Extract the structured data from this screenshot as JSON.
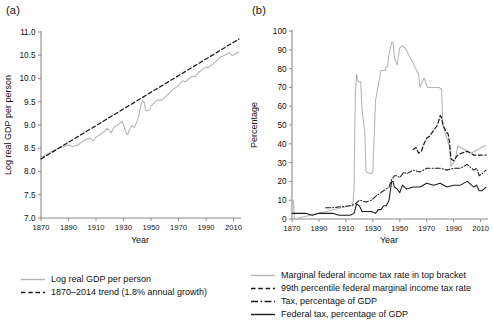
{
  "figure": {
    "panel_a_label": "(a)",
    "panel_b_label": "(b)"
  },
  "chart_data": [
    {
      "id": "panel_a",
      "type": "line",
      "title": "(a)",
      "xlabel": "Year",
      "ylabel": "Log real GDP per person",
      "xlim": [
        1870,
        2014
      ],
      "ylim": [
        7.0,
        11.0
      ],
      "xticks": [
        1870,
        1890,
        1910,
        1930,
        1950,
        1970,
        1990,
        2010
      ],
      "yticks": [
        7.0,
        7.5,
        8.0,
        8.5,
        9.0,
        9.5,
        10.0,
        10.5,
        11.0
      ],
      "ytick_labels": [
        "7.0",
        "7.5",
        "8.0",
        "8.5",
        "9.0",
        "9.5",
        "10.0",
        "10.5",
        "11.0"
      ],
      "grid": false,
      "legend_position": "below",
      "series": [
        {
          "name": "Log real GDP per person",
          "style": "solid",
          "color": "#b3b3b3",
          "x": [
            1870,
            1875,
            1880,
            1885,
            1890,
            1893,
            1896,
            1900,
            1905,
            1908,
            1910,
            1913,
            1916,
            1918,
            1920,
            1921,
            1923,
            1925,
            1929,
            1930,
            1932,
            1933,
            1934,
            1936,
            1938,
            1939,
            1941,
            1943,
            1944,
            1945,
            1946,
            1947,
            1949,
            1950,
            1953,
            1955,
            1958,
            1960,
            1965,
            1970,
            1973,
            1975,
            1980,
            1982,
            1985,
            1990,
            1991,
            1995,
            2000,
            2005,
            2007,
            2009,
            2011,
            2014
          ],
          "y": [
            8.3,
            8.38,
            8.47,
            8.52,
            8.57,
            8.54,
            8.56,
            8.64,
            8.72,
            8.66,
            8.74,
            8.79,
            8.86,
            8.93,
            8.88,
            8.83,
            8.95,
            8.98,
            9.08,
            9.0,
            8.82,
            8.79,
            8.87,
            8.99,
            8.95,
            9.02,
            9.18,
            9.47,
            9.53,
            9.5,
            9.32,
            9.3,
            9.33,
            9.4,
            9.5,
            9.54,
            9.53,
            9.59,
            9.74,
            9.85,
            9.95,
            9.93,
            10.05,
            10.04,
            10.14,
            10.25,
            10.23,
            10.31,
            10.45,
            10.52,
            10.55,
            10.49,
            10.52,
            10.57
          ]
        },
        {
          "name": "1870–2014 trend (1.8% annual growth)",
          "style": "dashed",
          "color": "#1a1a1a",
          "x": [
            1870,
            2014
          ],
          "y": [
            8.27,
            10.85
          ]
        }
      ],
      "legend": [
        {
          "label": "Log real GDP per person",
          "style": "solid",
          "color": "#b3b3b3"
        },
        {
          "label": "1870–2014 trend (1.8% annual growth)",
          "style": "dashed",
          "color": "#1a1a1a"
        }
      ]
    },
    {
      "id": "panel_b",
      "type": "line",
      "title": "(b)",
      "xlabel": "Year",
      "ylabel": "Percentage",
      "xlim": [
        1870,
        2014
      ],
      "ylim": [
        0,
        100
      ],
      "xticks": [
        1870,
        1890,
        1910,
        1930,
        1950,
        1970,
        1990,
        2010
      ],
      "yticks": [
        0,
        10,
        20,
        30,
        40,
        50,
        60,
        70,
        80,
        90,
        100
      ],
      "ytick_labels": [
        "0",
        "10",
        "20",
        "30",
        "40",
        "50",
        "60",
        "70",
        "80",
        "90",
        "100"
      ],
      "grid": false,
      "legend_position": "below",
      "series": [
        {
          "name": "Marginal federal income tax rate in top bracket",
          "style": "solid",
          "color": "#b3b3b3",
          "x": [
            1870,
            1871,
            1872,
            1913,
            1915,
            1916,
            1917,
            1918,
            1919,
            1921,
            1922,
            1924,
            1925,
            1929,
            1930,
            1932,
            1936,
            1939,
            1940,
            1941,
            1942,
            1944,
            1945,
            1946,
            1948,
            1950,
            1952,
            1954,
            1964,
            1965,
            1968,
            1970,
            1971,
            1976,
            1979,
            1981,
            1982,
            1987,
            1988,
            1991,
            1993,
            2003,
            2013,
            2014
          ],
          "y": [
            10,
            10,
            0,
            7,
            7,
            15,
            67,
            77,
            73,
            73,
            58,
            46,
            25,
            24,
            25,
            63,
            79,
            79,
            81,
            81,
            88,
            94,
            94,
            86,
            82,
            91,
            92,
            91,
            77,
            70,
            75,
            71,
            70,
            70,
            70,
            69,
            50,
            38,
            28,
            31,
            39,
            35,
            39,
            39
          ]
        },
        {
          "name": "99th percentile federal marginal income tax rate",
          "style": "dashed",
          "color": "#1a1a1a",
          "x": [
            1960,
            1962,
            1964,
            1966,
            1968,
            1970,
            1972,
            1974,
            1976,
            1978,
            1980,
            1981,
            1982,
            1984,
            1986,
            1987,
            1988,
            1990,
            1993,
            1996,
            2000,
            2005,
            2010,
            2014
          ],
          "y": [
            37,
            38,
            35,
            36,
            40,
            43,
            44,
            46,
            48,
            50,
            55,
            54,
            50,
            47,
            45,
            40,
            32,
            31,
            34,
            35,
            36,
            34,
            34,
            34
          ]
        },
        {
          "name": "Tax, percentage of GDP",
          "style": "dashdot",
          "color": "#1a1a1a",
          "x": [
            1895,
            1900,
            1913,
            1917,
            1920,
            1925,
            1929,
            1932,
            1934,
            1936,
            1938,
            1940,
            1942,
            1944,
            1946,
            1948,
            1950,
            1953,
            1955,
            1960,
            1965,
            1970,
            1975,
            1980,
            1985,
            1990,
            1995,
            2000,
            2005,
            2007,
            2009,
            2011,
            2014
          ],
          "y": [
            6,
            6,
            7,
            8,
            10,
            9,
            10,
            12,
            13,
            14,
            15,
            16,
            17,
            21,
            23,
            23,
            22,
            25,
            24,
            26,
            25,
            27,
            27,
            27,
            26,
            27,
            27,
            29,
            26,
            27,
            23,
            24,
            26
          ]
        },
        {
          "name": "Federal tax, percentage of GDP",
          "style": "solid",
          "color": "#1a1a1a",
          "x": [
            1870,
            1875,
            1880,
            1885,
            1890,
            1895,
            1900,
            1905,
            1910,
            1913,
            1916,
            1918,
            1920,
            1922,
            1925,
            1929,
            1932,
            1934,
            1936,
            1938,
            1940,
            1942,
            1944,
            1945,
            1946,
            1948,
            1950,
            1952,
            1955,
            1960,
            1965,
            1970,
            1975,
            1980,
            1985,
            1990,
            1995,
            2000,
            2005,
            2007,
            2009,
            2011,
            2014
          ],
          "y": [
            3,
            3,
            3,
            2,
            3,
            3,
            3,
            2,
            2,
            2,
            3,
            8,
            7,
            4,
            4,
            4,
            3,
            5,
            5,
            7,
            7,
            10,
            20,
            20,
            17,
            16,
            14,
            18,
            16,
            17,
            17,
            19,
            18,
            19,
            17,
            18,
            18,
            20,
            17,
            18,
            15,
            15,
            17
          ]
        }
      ],
      "legend": [
        {
          "label": "Marginal federal income tax rate in top bracket",
          "style": "solid",
          "color": "#b3b3b3"
        },
        {
          "label": "99th percentile federal marginal income tax rate",
          "style": "dashed",
          "color": "#1a1a1a"
        },
        {
          "label": "Tax, percentage of GDP",
          "style": "dashdot",
          "color": "#1a1a1a"
        },
        {
          "label": "Federal tax, percentage of GDP",
          "style": "solid",
          "color": "#1a1a1a"
        }
      ]
    }
  ]
}
